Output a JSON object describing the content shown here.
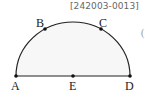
{
  "problem_code": "[242003-0013]",
  "edge_glyph": "(",
  "figure": {
    "type": "semicircle",
    "fill_color": "#f7f7f7",
    "stroke_color": "#222222",
    "center": "E",
    "diameter": [
      "A",
      "D"
    ],
    "points": [
      {
        "name": "A",
        "label": "A",
        "x": 16,
        "y": 76
      },
      {
        "name": "B",
        "label": "B",
        "x": 45,
        "y": 29
      },
      {
        "name": "C",
        "label": "C",
        "x": 101,
        "y": 29
      },
      {
        "name": "D",
        "label": "D",
        "x": 130,
        "y": 76
      },
      {
        "name": "E",
        "label": "E",
        "x": 73,
        "y": 76
      }
    ]
  }
}
